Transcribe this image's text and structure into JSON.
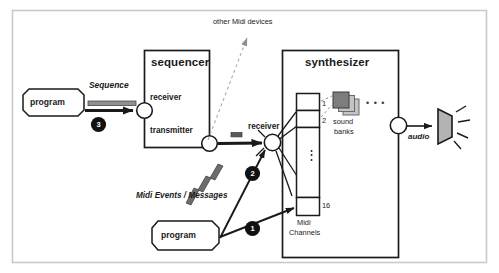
{
  "figure": {
    "frame_color": "#c9c9c9",
    "line_color": "#1a1a1a",
    "accent_gray": "#8f8f8f",
    "bank_dark": "#7d7d7d",
    "bank_light": "#c4c4c4",
    "speaker_fill": "#b3b3b3"
  },
  "boxes": {
    "sequencer": {
      "title": "sequencer",
      "ports": {
        "receiver": "receiver",
        "transmitter": "transmitter"
      }
    },
    "synthesizer": {
      "title": "synthesizer",
      "ports": {
        "receiver": "receiver"
      }
    }
  },
  "nodes": {
    "program_top": "program",
    "program_bottom": "program"
  },
  "labels": {
    "other_devices": "other Midi devices",
    "sequence": "Sequence",
    "midi_events": "Midi Events / Messages",
    "sound_banks_line1": "sound",
    "sound_banks_line2": "banks",
    "sound_banks_ellipsis": "• • •",
    "audio": "audio",
    "midi_channels_line1": "Midi",
    "midi_channels_line2": "Channels"
  },
  "channels": {
    "first": "1",
    "second": "2",
    "vertical_ellipsis": "⋮",
    "last": "16"
  },
  "steps": {
    "one": "1",
    "two": "2",
    "three": "3"
  }
}
